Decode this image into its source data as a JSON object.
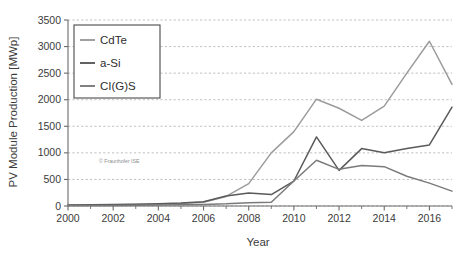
{
  "chart_data": {
    "type": "line",
    "title": "",
    "xlabel": "Year",
    "ylabel": "PV Module Production [MWp]",
    "xlim": [
      2000,
      2017
    ],
    "ylim": [
      0,
      3500
    ],
    "ytick_step": 500,
    "grid": true,
    "grid_style": "dotted-horizontal",
    "legend_position": "upper-left",
    "x": [
      2000,
      2001,
      2002,
      2003,
      2004,
      2005,
      2006,
      2007,
      2008,
      2009,
      2010,
      2011,
      2012,
      2013,
      2014,
      2015,
      2016,
      2017
    ],
    "xticks": [
      2000,
      2002,
      2004,
      2006,
      2008,
      2010,
      2012,
      2014,
      2016
    ],
    "xtick_labels": [
      "2000",
      "2002",
      "2004",
      "2006",
      "2008",
      "2010",
      "2012",
      "2014",
      "2016"
    ],
    "xminorticks": [
      2001,
      2003,
      2005,
      2007,
      2009,
      2011,
      2013,
      2015,
      2017
    ],
    "yticks": [
      0,
      500,
      1000,
      1500,
      2000,
      2500,
      3000,
      3500
    ],
    "ytick_labels": [
      "0",
      "500",
      "1000",
      "1500",
      "2000",
      "2500",
      "3000",
      "3500"
    ],
    "series": [
      {
        "name": "CdTe",
        "color": "#9c9c9c",
        "values": [
          15,
          18,
          22,
          28,
          35,
          45,
          70,
          180,
          420,
          1000,
          1400,
          2010,
          1840,
          1610,
          1880,
          2500,
          3100,
          2290
        ]
      },
      {
        "name": "a-Si",
        "color": "#5a5a5a",
        "values": [
          20,
          24,
          28,
          34,
          42,
          55,
          80,
          190,
          245,
          215,
          470,
          1300,
          670,
          1080,
          1000,
          1080,
          1150,
          1860
        ]
      },
      {
        "name": "CI(G)S",
        "color": "#7a7a7a",
        "values": [
          8,
          9,
          11,
          14,
          18,
          22,
          30,
          40,
          60,
          70,
          470,
          860,
          690,
          760,
          740,
          560,
          430,
          280
        ]
      }
    ]
  },
  "legend": {
    "items": [
      {
        "label": "CdTe",
        "color": "#9c9c9c"
      },
      {
        "label": "a-Si",
        "color": "#5a5a5a"
      },
      {
        "label": "CI(G)S",
        "color": "#7a7a7a"
      }
    ]
  },
  "watermark": {
    "text": "© Fraunhofer ISE"
  },
  "style": {
    "axis_color": "#6b6b6b",
    "grid_color": "#b9b9b9",
    "text_color": "#3b3b3b",
    "background": "#ffffff"
  }
}
